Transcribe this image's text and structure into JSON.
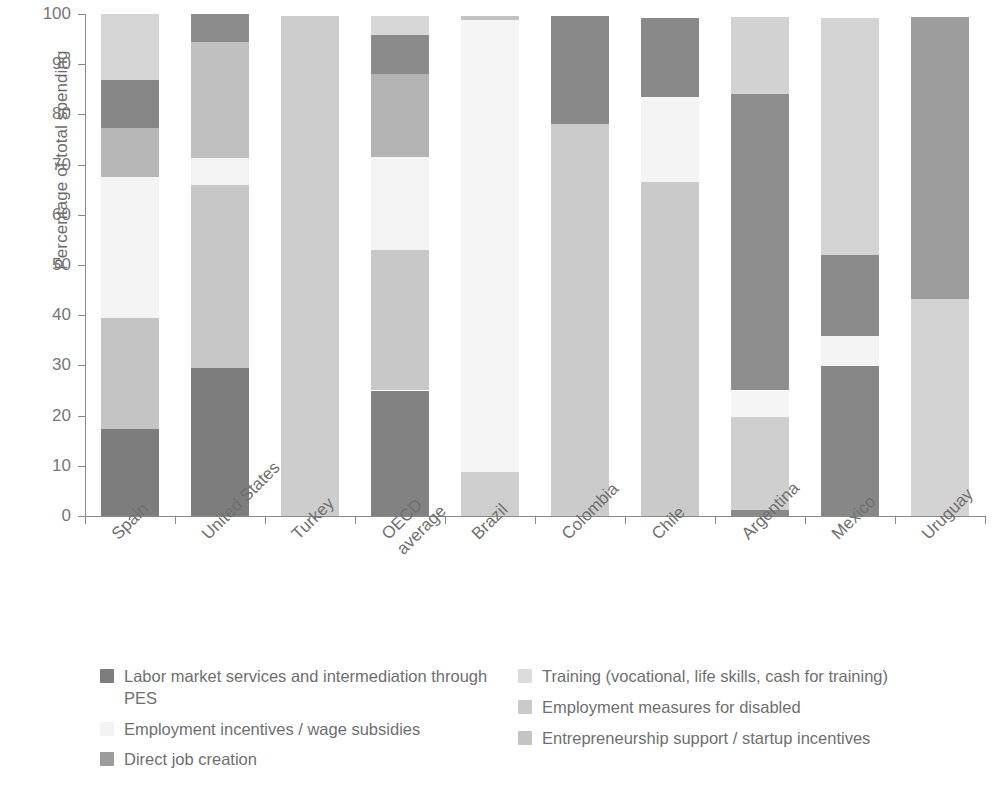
{
  "chart_data": {
    "type": "bar",
    "subtype": "stacked-100-percent",
    "title": "",
    "xlabel": "",
    "ylabel": "Percentage of total spending",
    "ylim": [
      0,
      100
    ],
    "yticks": [
      0,
      10,
      20,
      30,
      40,
      50,
      60,
      70,
      80,
      90,
      100
    ],
    "grid": false,
    "legend_position": "bottom",
    "categories": [
      "Spain",
      "United States",
      "Turkey",
      "OECD average",
      "Brazil",
      "Colombia",
      "Chile",
      "Argentina",
      "Mexico",
      "Uruguay"
    ],
    "series": [
      {
        "name": "Labor market services and intermediation through PES",
        "color": "#7d7d7d",
        "values": [
          17.3,
          29.5,
          0,
          25.0,
          0,
          0,
          0,
          1.0,
          30.0,
          0
        ]
      },
      {
        "name": "Training (vocational, life skills, cash for training)",
        "color": "#c9c9c9",
        "values": [
          22.2,
          0,
          99.5,
          28.0,
          8.7,
          78.0,
          0,
          0,
          0,
          0
        ]
      },
      {
        "name": "Employment incentives / wage subsidies",
        "color": "#f3f3f3",
        "values": [
          27.9,
          5.0,
          0,
          18.5,
          90.3,
          0,
          17.0,
          5.0,
          6.0,
          0
        ]
      },
      {
        "name": "Employment measures for disabled",
        "color": "#d9d9d9",
        "values": [
          8.8,
          0,
          0,
          0,
          0,
          0,
          66.5,
          19.0,
          0,
          0
        ]
      },
      {
        "name": "Entrepreneurship support / startup incentives",
        "color": "#bfbfbf",
        "values": [
          13.3,
          36.5,
          0,
          0,
          0,
          0,
          0,
          59.0,
          16.0,
          56.5
        ]
      },
      {
        "name": "Direct job creation",
        "color": "#9c9c9c",
        "values": [
          10.0,
          28.5,
          0,
          28.0,
          0.5,
          21.5,
          16.0,
          15.5,
          47.5,
          43.0
        ]
      }
    ],
    "stacks": [
      {
        "category": "Spain",
        "segments": [
          {
            "series": "Labor market services and intermediation through PES",
            "from": 0,
            "to": 17.3,
            "color": "#7d7d7d"
          },
          {
            "series": "Entrepreneurship support / startup incentives",
            "from": 17.3,
            "to": 39.5,
            "color": "#c4c4c4"
          },
          {
            "series": "Employment incentives / wage subsidies",
            "from": 39.5,
            "to": 67.5,
            "color": "#f4f4f4"
          },
          {
            "series": "Direct job creation",
            "from": 67.5,
            "to": 77.2,
            "color": "#b7b7b7"
          },
          {
            "series": "Labor market services and intermediation through PES",
            "from": 77.2,
            "to": 86.8,
            "color": "#878787"
          },
          {
            "series": "Training (vocational, life skills, cash for training)",
            "from": 86.8,
            "to": 100,
            "color": "#d5d5d5"
          }
        ]
      },
      {
        "category": "United States",
        "segments": [
          {
            "series": "Labor market services and intermediation through PES",
            "from": 0,
            "to": 29.5,
            "color": "#7d7d7d"
          },
          {
            "series": "Entrepreneurship support / startup incentives",
            "from": 29.5,
            "to": 66.0,
            "color": "#c7c7c7"
          },
          {
            "series": "Employment incentives / wage subsidies",
            "from": 66.0,
            "to": 71.3,
            "color": "#f4f4f4"
          },
          {
            "series": "Direct job creation",
            "from": 71.3,
            "to": 94.5,
            "color": "#c0c0c0"
          },
          {
            "series": "Labor market services and intermediation through PES",
            "from": 94.5,
            "to": 100,
            "color": "#8c8c8c"
          }
        ]
      },
      {
        "category": "Turkey",
        "segments": [
          {
            "series": "Training (vocational, life skills, cash for training)",
            "from": 0,
            "to": 99.7,
            "color": "#cdcdcd"
          }
        ]
      },
      {
        "category": "OECD average",
        "segments": [
          {
            "series": "Labor market services and intermediation through PES",
            "from": 0,
            "to": 25.0,
            "color": "#828282"
          },
          {
            "series": "Entrepreneurship support / startup incentives",
            "from": 25.0,
            "to": 53.0,
            "color": "#c8c8c8"
          },
          {
            "series": "Employment incentives / wage subsidies",
            "from": 53.0,
            "to": 71.5,
            "color": "#f4f4f4"
          },
          {
            "series": "Direct job creation",
            "from": 71.5,
            "to": 88.0,
            "color": "#b4b4b4"
          },
          {
            "series": "Labor market services and intermediation through PES",
            "from": 88.0,
            "to": 95.8,
            "color": "#8b8b8b"
          },
          {
            "series": "Training (vocational, life skills, cash for training)",
            "from": 95.8,
            "to": 99.7,
            "color": "#d7d7d7"
          }
        ]
      },
      {
        "category": "Brazil",
        "segments": [
          {
            "series": "Training (vocational, life skills, cash for training)",
            "from": 0,
            "to": 8.7,
            "color": "#cfcfcf"
          },
          {
            "series": "Employment incentives / wage subsidies",
            "from": 8.7,
            "to": 98.8,
            "color": "#f5f5f5"
          },
          {
            "series": "Direct job creation",
            "from": 98.8,
            "to": 99.7,
            "color": "#c3c3c3"
          }
        ]
      },
      {
        "category": "Colombia",
        "segments": [
          {
            "series": "Training (vocational, life skills, cash for training)",
            "from": 0,
            "to": 78.0,
            "color": "#cbcbcb"
          },
          {
            "series": "Labor market services and intermediation through PES",
            "from": 78.0,
            "to": 99.7,
            "color": "#898989"
          }
        ]
      },
      {
        "category": "Chile",
        "segments": [
          {
            "series": "Employment measures for disabled",
            "from": 0,
            "to": 66.5,
            "color": "#cacaca"
          },
          {
            "series": "Employment incentives / wage subsidies",
            "from": 66.5,
            "to": 83.5,
            "color": "#f4f4f4"
          },
          {
            "series": "Labor market services and intermediation through PES",
            "from": 83.5,
            "to": 99.3,
            "color": "#898989"
          }
        ]
      },
      {
        "category": "Argentina",
        "segments": [
          {
            "series": "Labor market services and intermediation through PES",
            "from": 0,
            "to": 1.2,
            "color": "#8a8a8a"
          },
          {
            "series": "Employment measures for disabled",
            "from": 1.2,
            "to": 19.8,
            "color": "#cfcfcf"
          },
          {
            "series": "Employment incentives / wage subsidies",
            "from": 19.8,
            "to": 25.0,
            "color": "#f5f5f5"
          },
          {
            "series": "Entrepreneurship support / startup incentives",
            "from": 25.0,
            "to": 84.0,
            "color": "#8e8e8e"
          },
          {
            "series": "Training (vocational, life skills, cash for training)",
            "from": 84.0,
            "to": 99.4,
            "color": "#d2d2d2"
          }
        ]
      },
      {
        "category": "Mexico",
        "segments": [
          {
            "series": "Labor market services and intermediation through PES",
            "from": 0,
            "to": 29.9,
            "color": "#878787"
          },
          {
            "series": "Employment incentives / wage subsidies",
            "from": 29.9,
            "to": 35.8,
            "color": "#f4f4f4"
          },
          {
            "series": "Direct job creation",
            "from": 35.8,
            "to": 52.0,
            "color": "#8b8b8b"
          },
          {
            "series": "Training (vocational, life skills, cash for training)",
            "from": 52.0,
            "to": 99.3,
            "color": "#d4d4d4"
          }
        ]
      },
      {
        "category": "Uruguay",
        "segments": [
          {
            "series": "Entrepreneurship support / startup incentives",
            "from": 0,
            "to": 43.2,
            "color": "#d3d3d3"
          },
          {
            "series": "Direct job creation",
            "from": 43.2,
            "to": 99.4,
            "color": "#9d9d9d"
          }
        ]
      }
    ]
  },
  "axis": {
    "y_title": "Percentage of total spending",
    "y_tick_labels": [
      "100",
      "90",
      "80",
      "70",
      "60",
      "50",
      "40",
      "30",
      "20",
      "10",
      "0"
    ]
  },
  "legend": {
    "left_column": [
      {
        "label": "Labor market services and intermediation through PES",
        "color": "#7d7d7d"
      },
      {
        "label": "Employment incentives / wage subsidies",
        "color": "#f3f3f3"
      },
      {
        "label": "Direct job creation",
        "color": "#9c9c9c"
      }
    ],
    "right_column": [
      {
        "label": "Training (vocational, life skills, cash for training)",
        "color": "#dcdcdc"
      },
      {
        "label": "Employment measures for disabled",
        "color": "#cacaca"
      },
      {
        "label": "Entrepreneurship support / startup incentives",
        "color": "#c4c4c4"
      }
    ]
  }
}
